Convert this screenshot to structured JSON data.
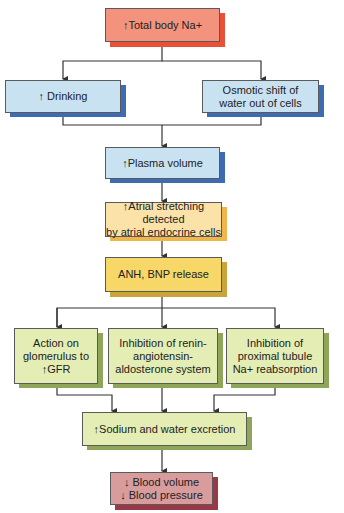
{
  "diagram": {
    "type": "flowchart",
    "nodes": {
      "total_na": {
        "label": "↑Total body Na+",
        "fill": "#f4937d",
        "shadow": "#e8503a"
      },
      "drinking": {
        "label": "↑ Drinking",
        "fill": "#c9e2f2",
        "shadow": "#3d6cb5"
      },
      "osmotic": {
        "label": "Osmotic shift of\nwater out of cells",
        "fill": "#c9e2f2",
        "shadow": "#3d6cb5"
      },
      "plasma": {
        "label": "↑Plasma volume",
        "fill": "#c9e2f2",
        "shadow": "#3d6cb5"
      },
      "atrial": {
        "label": "↑Atrial stretching detected\nby atrial endocrine cells",
        "fill": "#fbe2a8",
        "shadow": "#f0b64c"
      },
      "anh": {
        "label": "ANH, BNP release",
        "fill": "#f7d767",
        "shadow": "#c9a43a"
      },
      "glomerulus": {
        "label": "Action on\nglomerulus to\n↑GFR",
        "fill": "#e3edb4",
        "shadow": "#8fa65a"
      },
      "raas": {
        "label": "Inhibition of renin-\nangiotensin-\naldosterone system",
        "fill": "#e3edb4",
        "shadow": "#8fa65a"
      },
      "proximal": {
        "label": "Inhibition of\nproximal tubule\nNa+ reabsorption",
        "fill": "#e3edb4",
        "shadow": "#8fa65a"
      },
      "excretion": {
        "label": "↑Sodium and water excretion",
        "fill": "#e3edb4",
        "shadow": "#8fa65a"
      },
      "blood": {
        "label": "↓ Blood volume\n↓ Blood pressure",
        "fill": "#d99c9c",
        "shadow": "#9b3848"
      }
    },
    "edges": [
      [
        "total_na",
        "drinking"
      ],
      [
        "total_na",
        "osmotic"
      ],
      [
        "drinking",
        "plasma"
      ],
      [
        "osmotic",
        "plasma"
      ],
      [
        "plasma",
        "atrial"
      ],
      [
        "atrial",
        "anh"
      ],
      [
        "anh",
        "glomerulus"
      ],
      [
        "anh",
        "raas"
      ],
      [
        "anh",
        "proximal"
      ],
      [
        "glomerulus",
        "excretion"
      ],
      [
        "raas",
        "excretion"
      ],
      [
        "proximal",
        "excretion"
      ],
      [
        "excretion",
        "blood"
      ]
    ],
    "line_color": "#333333"
  }
}
